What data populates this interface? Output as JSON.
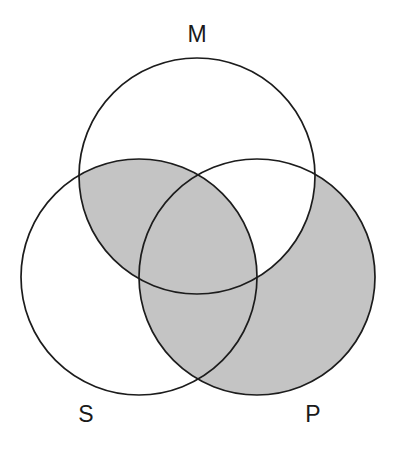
{
  "figure": {
    "type": "venn-3-circle",
    "background_color": "#ffffff",
    "stroke_color": "#1c1c1c",
    "shade_color": "#c4c4c4"
  },
  "labels": {
    "minor_term": "S",
    "middle_term": "M",
    "major_term": "P"
  },
  "circles": [
    {
      "key": "M",
      "label": "M",
      "cx": 197,
      "cy": 176,
      "r": 118,
      "label_x": 197,
      "label_y": 42
    },
    {
      "key": "S",
      "label": "S",
      "cx": 139,
      "cy": 277,
      "r": 118,
      "label_x": 86,
      "label_y": 422
    },
    {
      "key": "P",
      "label": "P",
      "cx": 257,
      "cy": 277,
      "r": 118,
      "label_x": 313,
      "label_y": 422
    }
  ],
  "regions": [
    {
      "key": "S_only",
      "name": "S only",
      "shaded": false
    },
    {
      "key": "M_only",
      "name": "M only",
      "shaded": false
    },
    {
      "key": "P_only",
      "name": "P only",
      "shaded": true
    },
    {
      "key": "SM",
      "name": "S and M, not P",
      "shaded": true
    },
    {
      "key": "MP",
      "name": "M and P, not S",
      "shaded": false
    },
    {
      "key": "SP",
      "name": "S and P, not M",
      "shaded": true
    },
    {
      "key": "SMP",
      "name": "S and M and P",
      "shaded": true
    }
  ]
}
